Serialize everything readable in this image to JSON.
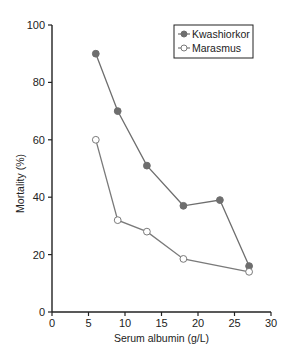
{
  "chart_data": {
    "type": "line",
    "title": "",
    "xlabel": "Serum albumin (g/L)",
    "ylabel": "Mortality (%)",
    "xlim": [
      0,
      30
    ],
    "ylim": [
      0,
      100
    ],
    "xticks": [
      0,
      5,
      10,
      15,
      20,
      25,
      30
    ],
    "yticks": [
      0,
      20,
      40,
      60,
      80,
      100
    ],
    "grid": false,
    "legend_position": "top-right",
    "series": [
      {
        "name": "Kwashiorkor",
        "marker": "filled-circle",
        "color": "#6e6e6e",
        "x": [
          6,
          9,
          13,
          18,
          23,
          27
        ],
        "y": [
          90,
          70,
          51,
          37,
          39,
          16
        ]
      },
      {
        "name": "Marasmus",
        "marker": "open-circle",
        "color": "#7a7a7a",
        "x": [
          6,
          9,
          13,
          18,
          27
        ],
        "y": [
          60,
          32,
          28,
          18.5,
          14
        ]
      }
    ]
  }
}
